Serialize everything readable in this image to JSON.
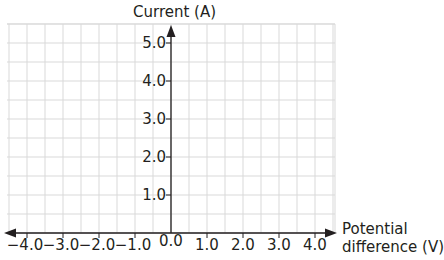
{
  "chart_data": {
    "type": "line",
    "title": "",
    "xlabel": "Potential difference (V)",
    "xlabel_lines": [
      "Potential",
      "difference (V)"
    ],
    "ylabel": "Current (A)",
    "x_ticks": [
      "−4.0",
      "−3.0",
      "−2.0",
      "−1.0",
      "0.0",
      "1.0",
      "2.0",
      "3.0",
      "4.0"
    ],
    "x_tick_values": [
      -4,
      -3,
      -2,
      -1,
      0,
      1,
      2,
      3,
      4
    ],
    "y_ticks": [
      "1.0",
      "2.0",
      "3.0",
      "4.0",
      "5.0"
    ],
    "y_tick_values": [
      1,
      2,
      3,
      4,
      5
    ],
    "xlim": [
      -4.5,
      4.5
    ],
    "ylim": [
      0,
      5.5
    ],
    "grid": true,
    "grid_step": {
      "x": 0.5,
      "y": 0.5
    },
    "series": [],
    "legend": null,
    "note": "Blank axes with grid; no data plotted"
  },
  "colors": {
    "grid": "#d9d9d9",
    "axis": "#231f20",
    "text": "#231f20"
  }
}
